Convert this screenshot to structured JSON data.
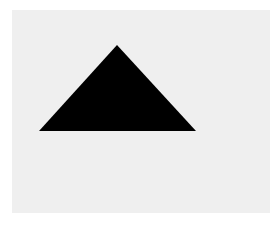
{
  "figure": {
    "background_color": "#ffffff",
    "panel_color": "#efefef",
    "shape": {
      "type": "triangle",
      "icon": "triangle-icon",
      "fill": "#000000",
      "points": "117,45 39,131 196,131"
    }
  }
}
